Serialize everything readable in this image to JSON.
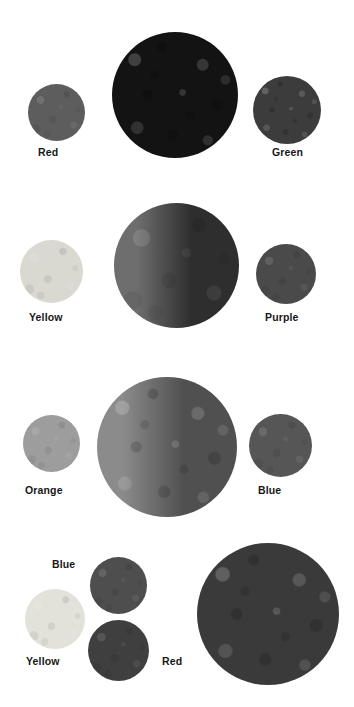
{
  "figure": {
    "background": "#ffffff",
    "width": 354,
    "height": 707,
    "rendering": "grayscale"
  },
  "rows": [
    {
      "id": "row-1",
      "left": {
        "label": "Red",
        "swatch_gray": "#5d5d5d",
        "x": 28,
        "y": 84,
        "size": 57
      },
      "right": {
        "label": "Green",
        "swatch_gray": "#3c3c3c",
        "x": 253,
        "y": 76,
        "size": 68
      },
      "mix": {
        "label": "",
        "swatch_gray": "#131313",
        "x": 112,
        "y": 32,
        "size": 126
      }
    },
    {
      "id": "row-2",
      "left": {
        "label": "Yellow",
        "swatch_gray": "#d9d9d2",
        "x": 20,
        "y": 240,
        "size": 63
      },
      "right": {
        "label": "Purple",
        "swatch_gray": "#4a4a4a",
        "x": 256,
        "y": 244,
        "size": 60
      },
      "mix": {
        "label": "",
        "swatch_gray": "#5a5a5a",
        "x": 114,
        "y": 203,
        "size": 125,
        "gradient": [
          "#6e6e6e",
          "#2e2e2e"
        ]
      }
    },
    {
      "id": "row-3",
      "left": {
        "label": "Orange",
        "swatch_gray": "#9d9d9d",
        "x": 23,
        "y": 415,
        "size": 57
      },
      "right": {
        "label": "Blue",
        "swatch_gray": "#565656",
        "x": 249,
        "y": 414,
        "size": 63
      },
      "mix": {
        "label": "",
        "swatch_gray": "#6a6a6a",
        "x": 97,
        "y": 377,
        "size": 140,
        "gradient": [
          "#8b8b8b",
          "#505050"
        ]
      }
    },
    {
      "id": "row-4",
      "swatches": [
        {
          "label": "Blue",
          "swatch_gray": "#4e4e4e",
          "x": 90,
          "y": 557,
          "size": 57
        },
        {
          "label": "Yellow",
          "swatch_gray": "#e2e2da",
          "x": 25,
          "y": 589,
          "size": 60
        },
        {
          "label": "Red",
          "swatch_gray": "#3f3f3f",
          "x": 88,
          "y": 620,
          "size": 61
        }
      ],
      "mix": {
        "label": "",
        "swatch_gray": "#3a3a3a",
        "x": 197,
        "y": 543,
        "size": 142
      }
    }
  ],
  "labels": [
    {
      "name": "label-red-1",
      "text": "Red",
      "x": 38,
      "y": 146
    },
    {
      "name": "label-green-1",
      "text": "Green",
      "x": 272,
      "y": 146
    },
    {
      "name": "label-yellow-2",
      "text": "Yellow",
      "x": 29,
      "y": 311
    },
    {
      "name": "label-purple-2",
      "text": "Purple",
      "x": 265,
      "y": 311
    },
    {
      "name": "label-orange-3",
      "text": "Orange",
      "x": 25,
      "y": 484
    },
    {
      "name": "label-blue-3",
      "text": "Blue",
      "x": 258,
      "y": 484
    },
    {
      "name": "label-blue-4",
      "text": "Blue",
      "x": 52,
      "y": 558
    },
    {
      "name": "label-yellow-4",
      "text": "Yellow",
      "x": 26,
      "y": 655
    },
    {
      "name": "label-red-4",
      "text": "Red",
      "x": 162,
      "y": 655
    }
  ]
}
